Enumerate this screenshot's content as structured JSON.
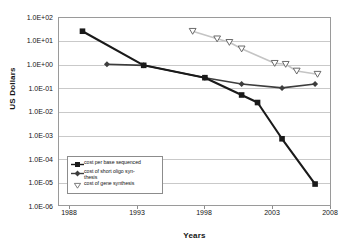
{
  "chart": {
    "type": "line",
    "xlabel": "Years",
    "ylabel": "US Dollars",
    "x_ticks": [
      "1988",
      "1993",
      "1998",
      "2003",
      "2008"
    ],
    "y_ticks": [
      "1.0E+02",
      "1.0E+01",
      "1.0E+00",
      "1.0E-01",
      "1.0E-02",
      "1.0E-03",
      "1.0E-04",
      "1.0E-05",
      "1.0E-06"
    ],
    "legend": [
      {
        "label": "cost per base sequenced",
        "label_line1": "cost per base sequenced",
        "label_line2": "",
        "marker": "square-marker",
        "color": "#1a1a1a"
      },
      {
        "label": "cost of short oligo synthesis",
        "label_line1": "cost of short oligo syn-",
        "label_line2": "thesis",
        "marker": "diamond-marker",
        "color": "#3d3d3d"
      },
      {
        "label": "cost of gene synthesis",
        "label_line1": "cost of gene synthesis",
        "label_line2": "",
        "marker": "triangle-down-marker",
        "color": "#c4c4c4"
      }
    ]
  },
  "chart_data": {
    "type": "line",
    "title": "",
    "subtitle": "",
    "xlabel": "Years",
    "ylabel": "US Dollars",
    "xlim": [
      1988,
      2010.3
    ],
    "ylim": [
      1e-06,
      100.0
    ],
    "yscale": "log",
    "grid": true,
    "legend_position": "inside-lower-left",
    "x_tick_labels": [
      "1988",
      "1993",
      "1998",
      "2003",
      "2008"
    ],
    "x_tick_values": [
      1988,
      1993,
      1998,
      2003,
      2008
    ],
    "y_tick_labels": [
      "1.0E+02",
      "1.0E+01",
      "1.0E+00",
      "1.0E-01",
      "1.0E-02",
      "1.0E-03",
      "1.0E-04",
      "1.0E-05",
      "1.0E-06"
    ],
    "y_tick_values": [
      100,
      10,
      1,
      0.1,
      0.01,
      0.001,
      0.0001,
      1e-05,
      1e-06
    ],
    "series": [
      {
        "name": "cost per base sequenced",
        "marker": "square",
        "color": "#1a1a1a",
        "x": [
          1990,
          1995,
          2000,
          2003,
          2004.3,
          2006.3,
          2009
        ],
        "y": [
          25,
          0.9,
          0.27,
          0.05,
          0.024,
          0.0007,
          8.5e-06
        ]
      },
      {
        "name": "cost of short oligo synthesis",
        "marker": "diamond",
        "color": "#3d3d3d",
        "x": [
          1992,
          1995,
          2000,
          2003,
          2006.3,
          2009
        ],
        "y": [
          1.0,
          0.9,
          0.27,
          0.145,
          0.1,
          0.145
        ]
      },
      {
        "name": "cost of gene synthesis",
        "marker": "triangle-down",
        "color": "#c4c4c4",
        "x": [
          1999,
          2001,
          2002,
          2003,
          2005.7,
          2006.6,
          2007.5,
          2009.2
        ],
        "y": [
          25,
          12,
          8.5,
          4.5,
          1.1,
          1.0,
          0.52,
          0.38
        ]
      }
    ]
  }
}
